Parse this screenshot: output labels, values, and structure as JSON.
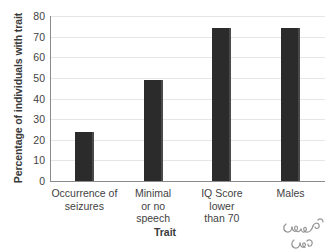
{
  "chart_data": {
    "type": "bar",
    "title": "",
    "subtitle": "",
    "xlabel": "Trait",
    "ylabel": "Percentage of individuals with trait",
    "categories": [
      "Occurrence of\nseizures",
      "Minimal\nor no\nspeech",
      "IQ Score\nlower\nthan 70",
      "Males"
    ],
    "category_lines": [
      [
        "Occurrence of",
        "seizures"
      ],
      [
        "Minimal",
        "or no",
        "speech"
      ],
      [
        "IQ Score",
        "lower",
        "than 70"
      ],
      [
        "Males"
      ]
    ],
    "values": [
      24,
      49,
      74,
      74
    ],
    "ylim": [
      0,
      80
    ],
    "yticks": [
      0,
      10,
      20,
      30,
      40,
      50,
      60,
      70,
      80
    ],
    "ytick_labels": [
      "0",
      "10",
      "20",
      "30",
      "40",
      "50",
      "60",
      "70",
      "80"
    ],
    "grid": true,
    "grid_axis": "y",
    "legend": false,
    "legend_position": "none",
    "bar_color": "#2b2b2b",
    "bar_edge_color": "#4a4a4a",
    "grid_color": "#e6e6e6",
    "axis_color": "#8a8a8a",
    "text_color": "#3f3f3f"
  },
  "watermark": {
    "name": "handwritten-signature-watermark"
  }
}
